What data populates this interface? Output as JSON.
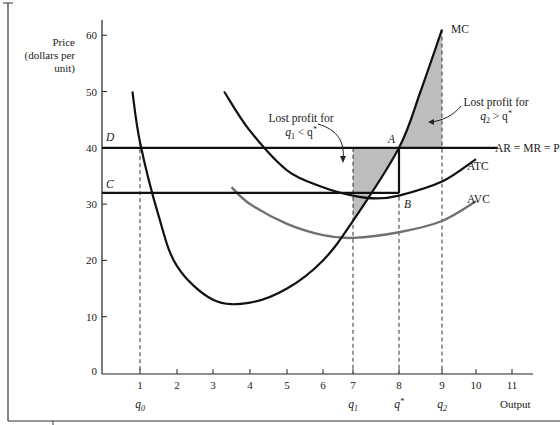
{
  "chart_data": {
    "type": "line",
    "title": "",
    "xlabel": "Output",
    "ylabel": "Price (dollars per unit)",
    "ylabel_lines": [
      "Price",
      "(dollars per",
      "unit)"
    ],
    "xlim": [
      0,
      11.5
    ],
    "ylim": [
      0,
      62
    ],
    "grid": false,
    "x_ticks": [
      1,
      2,
      3,
      4,
      5,
      6,
      7,
      8,
      9,
      10,
      11
    ],
    "x_tick_labels": [
      "1",
      "2",
      "3",
      "4",
      "5",
      "6",
      "7",
      "8",
      "9",
      "10",
      "11"
    ],
    "y_ticks": [
      0,
      10,
      20,
      30,
      40,
      50,
      60
    ],
    "y_tick_labels": [
      "0",
      "10",
      "20",
      "30",
      "40",
      "50",
      "60"
    ],
    "quantity_markers": [
      {
        "x": 1,
        "label": "q0",
        "label_main": "q",
        "label_sub": "0"
      },
      {
        "x": 7,
        "label": "q1",
        "label_main": "q",
        "label_sub": "1"
      },
      {
        "x": 8,
        "label": "q*",
        "label_main": "q",
        "label_sup": "*"
      },
      {
        "x": 9,
        "label": "q2",
        "label_main": "q",
        "label_sub": "2"
      }
    ],
    "series": [
      {
        "name": "MC",
        "color": "#111111",
        "x": [
          0.8,
          1,
          1.5,
          2,
          3,
          4,
          5,
          6,
          7,
          8,
          8.5,
          9
        ],
        "values": [
          50,
          41,
          28,
          19,
          13,
          12.5,
          15,
          20,
          27,
          40,
          50,
          61
        ]
      },
      {
        "name": "ATC",
        "color": "#111111",
        "x": [
          3.3,
          4,
          5,
          6,
          7,
          7.5,
          8,
          9,
          10
        ],
        "values": [
          50,
          43,
          36,
          33,
          31.5,
          31,
          31.5,
          34,
          38
        ]
      },
      {
        "name": "AVC",
        "color": "#6e6e6e",
        "x": [
          3.5,
          4,
          5,
          6,
          7,
          8,
          9,
          10
        ],
        "values": [
          33,
          30,
          26.5,
          24.5,
          24,
          25,
          27,
          30.5
        ]
      },
      {
        "name": "AR = MR = P",
        "color": "#111111",
        "x": [
          0,
          10.6
        ],
        "values": [
          40,
          40
        ]
      },
      {
        "name": "C (average cost at q*)",
        "color": "#111111",
        "x": [
          0,
          8
        ],
        "values": [
          32,
          32
        ]
      }
    ],
    "points": [
      {
        "label": "A",
        "x": 8,
        "y": 40
      },
      {
        "label": "B",
        "x": 8,
        "y": 32
      },
      {
        "label": "D",
        "x": 0,
        "y": 40
      },
      {
        "label": "C",
        "x": 0,
        "y": 32
      }
    ],
    "shaded_regions": [
      {
        "name": "Lost profit for q1 < q*",
        "x_from": 7,
        "x_to": 8,
        "between": [
          "P",
          "MC"
        ],
        "color": "#bdbdbd"
      },
      {
        "name": "Lost profit for q2 > q*",
        "x_from": 8,
        "x_to": 9,
        "between": [
          "MC",
          "P"
        ],
        "color": "#bdbdbd"
      }
    ],
    "annotations": [
      {
        "text_lines": [
          "Lost profit for",
          "q1 < q*"
        ],
        "points_to": "shaded region between 7 and 8"
      },
      {
        "text_lines": [
          "Lost profit for",
          "q2 > q*"
        ],
        "points_to": "shaded region between 8 and 9"
      }
    ]
  },
  "labels": {
    "y_title_1": "Price",
    "y_title_2": "(dollars per",
    "y_title_3": "unit)",
    "x_title": "Output",
    "mc": "MC",
    "atc": "ATC",
    "avc": "AVC",
    "price_line": "AR = MR = P",
    "point_a": "A",
    "point_b": "B",
    "point_c": "C",
    "point_d": "D",
    "lost1_line1": "Lost profit for",
    "lost1_q": "q",
    "lost1_sub": "1",
    "lost1_rest": " < q",
    "lost1_star": "*",
    "lost2_line1": "Lost profit for",
    "lost2_q": "q",
    "lost2_sub": "2",
    "lost2_rest": " > q",
    "lost2_star": "*",
    "q0_main": "q",
    "q0_sub": "0",
    "q1_main": "q",
    "q1_sub": "1",
    "qstar_main": "q",
    "qstar_sup": "*",
    "q2_main": "q",
    "q2_sub": "2"
  }
}
